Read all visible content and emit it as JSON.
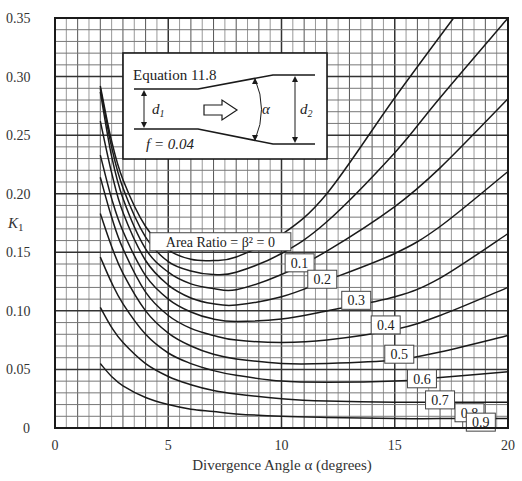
{
  "chart_data": {
    "type": "line",
    "title": "",
    "xlabel": "Divergence Angle α (degrees)",
    "ylabel": "K1",
    "xlim": [
      0,
      20
    ],
    "ylim": [
      0,
      0.35
    ],
    "x_ticks": [
      0,
      5,
      10,
      15,
      20
    ],
    "x_tick_labels": [
      "0",
      "5",
      "10",
      "15",
      "20"
    ],
    "y_ticks": [
      0,
      0.05,
      0.1,
      0.15,
      0.2,
      0.25,
      0.3,
      0.35
    ],
    "y_tick_labels": [
      "0",
      "0.05",
      "0.10",
      "0.15",
      "0.20",
      "0.25",
      "0.30",
      "0.35"
    ],
    "grid": {
      "major_x": 5,
      "minor_x": 0.5,
      "major_y": 0.05,
      "minor_y": 0.01
    },
    "legend": "inline labels",
    "series": [
      {
        "name": "Area Ratio = β² = 0",
        "label": "Area Ratio = β² = 0",
        "x": [
          2,
          2.5,
          3,
          4,
          5,
          6,
          7,
          8,
          10,
          12,
          15,
          17.6
        ],
        "values": [
          0.292,
          0.245,
          0.212,
          0.172,
          0.152,
          0.144,
          0.143,
          0.146,
          0.165,
          0.2,
          0.282,
          0.35
        ]
      },
      {
        "name": "0.1",
        "label": "0.1",
        "x": [
          2,
          2.5,
          3,
          4,
          5,
          6,
          7,
          8,
          10,
          12,
          15,
          17,
          20
        ],
        "values": [
          0.29,
          0.24,
          0.205,
          0.163,
          0.142,
          0.134,
          0.131,
          0.133,
          0.149,
          0.176,
          0.235,
          0.282,
          0.35
        ]
      },
      {
        "name": "0.2",
        "label": "0.2",
        "x": [
          2,
          2.5,
          3,
          4,
          5,
          6,
          7,
          8,
          10,
          12,
          15,
          17,
          20
        ],
        "values": [
          0.287,
          0.232,
          0.196,
          0.153,
          0.133,
          0.123,
          0.119,
          0.118,
          0.131,
          0.151,
          0.189,
          0.222,
          0.281
        ]
      },
      {
        "name": "0.3",
        "label": "0.3",
        "x": [
          2,
          2.5,
          3,
          4,
          5,
          6,
          7,
          8,
          10,
          12,
          15,
          17,
          20
        ],
        "values": [
          0.262,
          0.218,
          0.184,
          0.143,
          0.122,
          0.111,
          0.106,
          0.105,
          0.112,
          0.126,
          0.149,
          0.172,
          0.219
        ]
      },
      {
        "name": "0.4",
        "label": "0.4",
        "x": [
          2,
          2.5,
          3,
          4,
          5,
          6,
          7,
          8,
          10,
          12,
          15,
          17,
          20
        ],
        "values": [
          0.233,
          0.196,
          0.168,
          0.13,
          0.11,
          0.099,
          0.093,
          0.091,
          0.093,
          0.1,
          0.112,
          0.128,
          0.166
        ]
      },
      {
        "name": "0.5",
        "label": "0.5",
        "x": [
          2,
          2.5,
          3,
          4,
          5,
          6,
          7,
          8,
          10,
          12,
          15,
          17,
          20
        ],
        "values": [
          0.214,
          0.18,
          0.153,
          0.116,
          0.096,
          0.085,
          0.079,
          0.075,
          0.073,
          0.075,
          0.084,
          0.096,
          0.12
        ]
      },
      {
        "name": "0.6",
        "label": "0.6",
        "x": [
          2,
          2.5,
          3,
          4,
          5,
          6,
          7,
          8,
          10,
          12,
          15,
          17,
          20
        ],
        "values": [
          0.183,
          0.155,
          0.132,
          0.1,
          0.081,
          0.07,
          0.063,
          0.059,
          0.055,
          0.055,
          0.058,
          0.065,
          0.079
        ]
      },
      {
        "name": "0.7",
        "label": "0.7",
        "x": [
          2,
          2.5,
          3,
          4,
          5,
          6,
          7,
          8,
          10,
          12,
          15,
          17,
          20
        ],
        "values": [
          0.146,
          0.124,
          0.106,
          0.08,
          0.064,
          0.055,
          0.049,
          0.045,
          0.04,
          0.039,
          0.04,
          0.043,
          0.048
        ]
      },
      {
        "name": "0.8",
        "label": "0.8",
        "x": [
          2,
          2.5,
          3,
          4,
          5,
          6,
          7,
          8,
          10,
          12,
          15,
          17,
          20
        ],
        "values": [
          0.103,
          0.086,
          0.073,
          0.055,
          0.044,
          0.037,
          0.032,
          0.029,
          0.025,
          0.023,
          0.022,
          0.022,
          0.022
        ]
      },
      {
        "name": "0.9",
        "label": "0.9",
        "x": [
          2,
          2.5,
          3,
          4,
          5,
          6,
          7,
          8,
          10,
          12,
          15,
          17,
          20
        ],
        "values": [
          0.055,
          0.044,
          0.036,
          0.026,
          0.02,
          0.016,
          0.014,
          0.012,
          0.01,
          0.009,
          0.008,
          0.008,
          0.008
        ]
      }
    ],
    "curve_labels": [
      {
        "text": "Area Ratio = β² = 0",
        "x": 7.3,
        "y": 0.159
      },
      {
        "text": "0.1",
        "x": 10.8,
        "y": 0.141
      },
      {
        "text": "0.2",
        "x": 11.8,
        "y": 0.127
      },
      {
        "text": "0.3",
        "x": 13.3,
        "y": 0.109
      },
      {
        "text": "0.4",
        "x": 14.6,
        "y": 0.088
      },
      {
        "text": "0.5",
        "x": 15.2,
        "y": 0.063
      },
      {
        "text": "0.6",
        "x": 16.2,
        "y": 0.042
      },
      {
        "text": "0.7",
        "x": 17.0,
        "y": 0.024
      },
      {
        "text": "0.8",
        "x": 18.3,
        "y": 0.013
      },
      {
        "text": "0.9",
        "x": 18.8,
        "y": 0.005
      }
    ],
    "inset": {
      "title": "Equation 11.8",
      "friction": "f = 0.04",
      "d1_label": "d1",
      "d2_label": "d2",
      "angle_label": "α"
    }
  }
}
